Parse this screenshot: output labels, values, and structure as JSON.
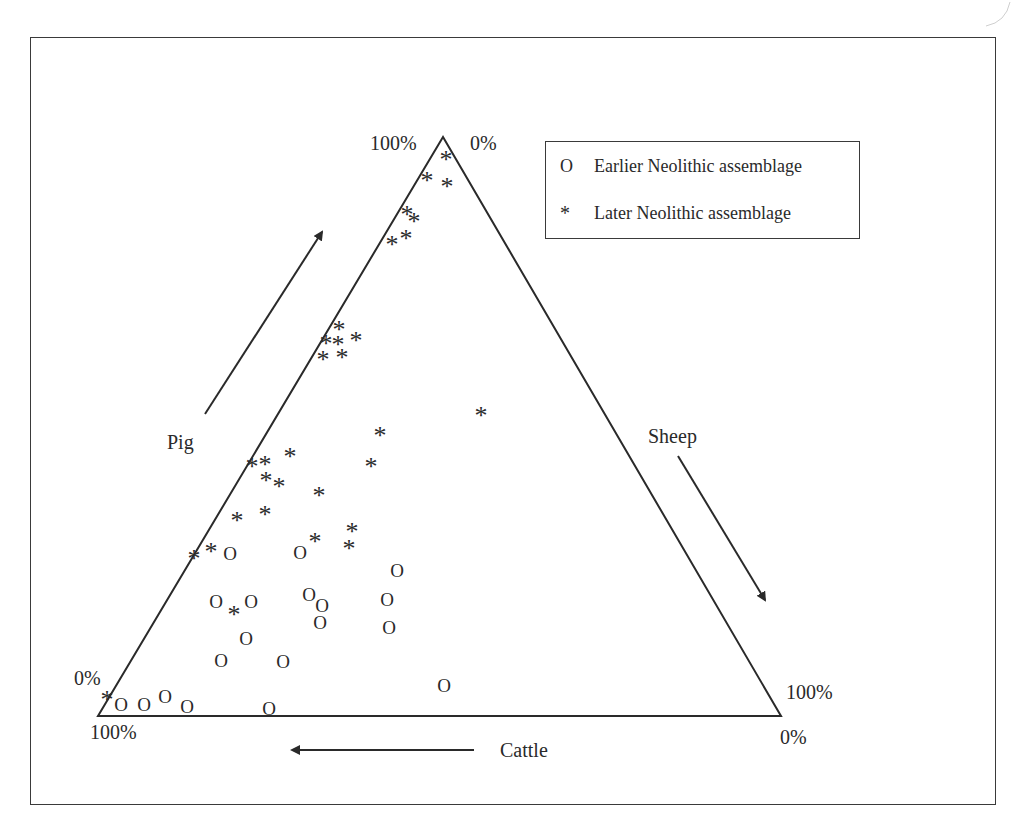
{
  "chart_data": {
    "type": "scatter",
    "subtype": "ternary",
    "title": "",
    "axes": {
      "pig": {
        "label": "Pig",
        "apex": "top",
        "start_label": "0%",
        "end_label": "100%"
      },
      "sheep": {
        "label": "Sheep",
        "apex": "bottom-right",
        "start_label": "0%",
        "end_label": "100%"
      },
      "cattle": {
        "label": "Cattle",
        "apex": "bottom-left",
        "start_label": "0%",
        "end_label": "100%"
      }
    },
    "corner_labels": {
      "top_left": "100%",
      "top_right": "0%",
      "left_mid": "0%",
      "bottom_left": "100%",
      "right_mid": "100%",
      "bottom_right": "0%"
    },
    "legend": [
      {
        "symbol": "O",
        "label": "Earlier Neolithic assemblage"
      },
      {
        "symbol": "*",
        "label": "Later Neolithic assemblage"
      }
    ],
    "legend_position": "top-right",
    "grid": false,
    "series": [
      {
        "name": "Earlier Neolithic assemblage",
        "marker": "O",
        "points_px": [
          [
            230,
            553
          ],
          [
            300,
            552
          ],
          [
            397,
            570
          ],
          [
            216,
            601
          ],
          [
            251,
            601
          ],
          [
            309,
            594
          ],
          [
            322,
            605
          ],
          [
            387,
            599
          ],
          [
            320,
            622
          ],
          [
            389,
            627
          ],
          [
            246,
            638
          ],
          [
            221,
            660
          ],
          [
            283,
            661
          ],
          [
            444,
            685
          ],
          [
            121,
            704
          ],
          [
            144,
            704
          ],
          [
            165,
            696
          ],
          [
            187,
            706
          ],
          [
            269,
            708
          ]
        ]
      },
      {
        "name": "Later Neolithic assemblage",
        "marker": "*",
        "points_px": [
          [
            446,
            157
          ],
          [
            427,
            178
          ],
          [
            447,
            184
          ],
          [
            407,
            212
          ],
          [
            414,
            219
          ],
          [
            392,
            242
          ],
          [
            406,
            236
          ],
          [
            339,
            327
          ],
          [
            326,
            341
          ],
          [
            338,
            342
          ],
          [
            356,
            338
          ],
          [
            323,
            357
          ],
          [
            342,
            355
          ],
          [
            481,
            413
          ],
          [
            380,
            433
          ],
          [
            371,
            464
          ],
          [
            252,
            464
          ],
          [
            265,
            462
          ],
          [
            290,
            454
          ],
          [
            266,
            478
          ],
          [
            279,
            484
          ],
          [
            319,
            493
          ],
          [
            237,
            518
          ],
          [
            265,
            512
          ],
          [
            194,
            556
          ],
          [
            211,
            549
          ],
          [
            315,
            539
          ],
          [
            352,
            529
          ],
          [
            349,
            546
          ],
          [
            234,
            612
          ],
          [
            107,
            697
          ]
        ]
      }
    ],
    "triangle_px": {
      "apex": [
        443,
        137
      ],
      "bottom_left": [
        98,
        716
      ],
      "bottom_right": [
        781,
        716
      ]
    }
  },
  "labels": {
    "pig": "Pig",
    "sheep": "Sheep",
    "cattle": "Cattle",
    "top_left_pct": "100%",
    "top_right_pct": "0%",
    "left_pct": "0%",
    "bottom_left_pct": "100%",
    "right_pct": "100%",
    "bottom_right_pct": "0%"
  },
  "legend": {
    "earlier_symbol": "O",
    "earlier_label": "Earlier Neolithic assemblage",
    "later_symbol": "*",
    "later_label": "Later Neolithic assemblage"
  }
}
